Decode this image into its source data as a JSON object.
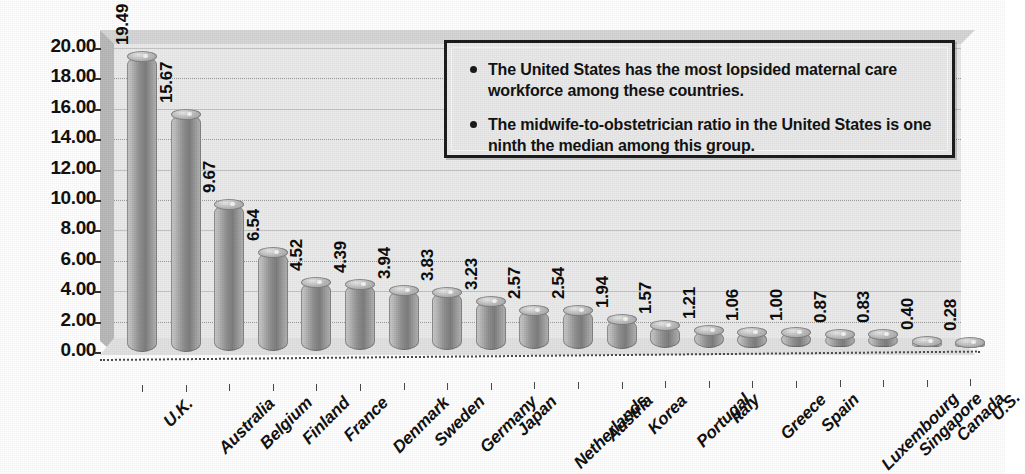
{
  "chart_data": {
    "type": "bar",
    "title": "",
    "subtitle": "",
    "xlabel": "",
    "ylabel": "",
    "ylim": [
      0,
      20
    ],
    "ytick_step": 2,
    "ytick_labels": [
      "0.00",
      "2.00",
      "4.00",
      "6.00",
      "8.00",
      "10.00",
      "12.00",
      "14.00",
      "16.00",
      "18.00",
      "20.00"
    ],
    "grid": true,
    "legend": "none",
    "style": "3d-cylinder",
    "bar_color": "#9a9a9a",
    "plot_background": "#ebebeb",
    "categories": [
      "U.K.",
      "Australia",
      "Belgium",
      "Finland",
      "France",
      "Denmark",
      "Sweden",
      "Germany",
      "Japan",
      "Netherlands",
      "Austria",
      "Korea",
      "Portugal",
      "Italy",
      "Greece",
      "Spain",
      "Luxembourg",
      "Singapore",
      "Canada",
      "U.S."
    ],
    "values": [
      19.49,
      15.67,
      9.67,
      6.54,
      4.52,
      4.39,
      3.94,
      3.83,
      3.23,
      2.57,
      2.54,
      1.94,
      1.57,
      1.21,
      1.06,
      1.0,
      0.87,
      0.83,
      0.4,
      0.28
    ],
    "value_labels": [
      "19.49",
      "15.67",
      "9.67",
      "6.54",
      "4.52",
      "4.39",
      "3.94",
      "3.83",
      "3.23",
      "2.57",
      "2.54",
      "1.94",
      "1.57",
      "1.21",
      "1.06",
      "1.00",
      "0.87",
      "0.83",
      "0.40",
      "0.28"
    ],
    "annotations": [
      "The United States has the most lopsided maternal care workforce among these countries.",
      "The midwife-to-obstetrician ratio in the United States is one ninth the median among this group."
    ]
  },
  "callout": {
    "bullets": [
      "The United States has the most lopsided maternal care workforce among these countries.",
      "The midwife-to-obstetrician ratio in the United States is one ninth the median among this group."
    ]
  }
}
